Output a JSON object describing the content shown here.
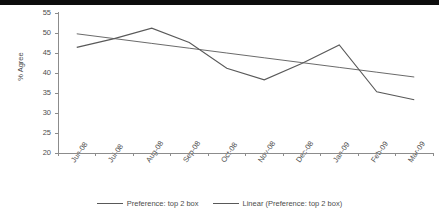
{
  "chart_data": {
    "type": "line",
    "title": "",
    "xlabel": "",
    "ylabel": "% Agree",
    "ylim": [
      20,
      55
    ],
    "ytick_step": 5,
    "yticks": [
      55,
      50,
      45,
      40,
      35,
      30,
      25,
      20
    ],
    "grid": false,
    "legend_position": "bottom",
    "categories": [
      "Jun-08",
      "Jul-08",
      "Aug-08",
      "Sep-08",
      "Oct-08",
      "Nov-08",
      "Dec-08",
      "Jan-09",
      "Feb-09",
      "Mar-09"
    ],
    "series": [
      {
        "name": "Preference: top 2 box",
        "type": "line",
        "color": "#595959",
        "values": [
          46.4,
          48.6,
          51.2,
          47.6,
          41.2,
          38.3,
          42.4,
          47.0,
          35.3,
          33.3
        ]
      },
      {
        "name": "Linear (Preference: top 2 box)",
        "type": "trendline",
        "color": "#595959",
        "values": [
          49.8,
          48.6,
          47.4,
          46.2,
          45.0,
          43.8,
          42.6,
          41.4,
          40.2,
          39.0
        ]
      }
    ]
  },
  "axis": {
    "y_label": "% Agree",
    "y_tick_labels": [
      "55",
      "50",
      "45",
      "40",
      "35",
      "30",
      "25",
      "20"
    ],
    "x_tick_labels": [
      "Jun-08",
      "Jul-08",
      "Aug-08",
      "Sep-08",
      "Oct-08",
      "Nov-08",
      "Dec-08",
      "Jan-09",
      "Feb-09",
      "Mar-09"
    ]
  },
  "legend": {
    "items": [
      {
        "label": "Preference: top 2 box"
      },
      {
        "label": "Linear (Preference: top 2 box)"
      }
    ]
  },
  "colors": {
    "series_line": "#595959",
    "trend_line": "#595959",
    "axis": "#8c8c8c",
    "text": "#4d4d4d",
    "top_bar": "#0d0d0d"
  }
}
